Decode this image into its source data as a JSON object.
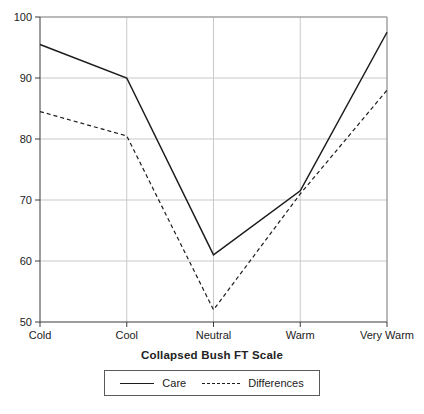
{
  "chart_data": {
    "type": "line",
    "categories": [
      "Cold",
      "Cool",
      "Neutral",
      "Warm",
      "Very Warm"
    ],
    "series": [
      {
        "name": "Care",
        "style": "solid",
        "values": [
          95.5,
          90,
          61,
          71.5,
          97.5
        ]
      },
      {
        "name": "Differences",
        "style": "dashed",
        "values": [
          84.5,
          80.5,
          52,
          71,
          88
        ]
      }
    ],
    "title": "",
    "xlabel": "Collapsed Bush FT Scale",
    "ylabel": "",
    "ylim": [
      50,
      100
    ],
    "yticks": [
      50,
      60,
      70,
      80,
      90,
      100
    ],
    "grid": true,
    "legend_position": "bottom",
    "colors": {
      "line": "#1c1c1c",
      "grid": "#c9c9c9",
      "frame": "#8f8f8f",
      "axis": "#3a3a3a",
      "text": "#222222"
    }
  }
}
